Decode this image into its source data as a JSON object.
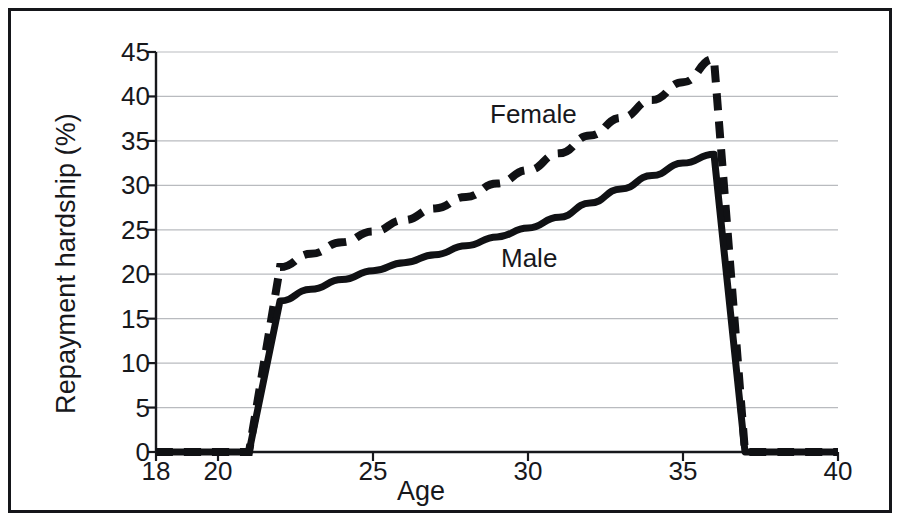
{
  "figure": {
    "border_color": "#15161a",
    "background": "#ffffff",
    "ink_color": "#17181c",
    "gridline_color": "#b9bbbf"
  },
  "axes": {
    "y_title": "Repayment hardship (%)",
    "x_title": "Age",
    "y_ticks": [
      "0",
      "5",
      "10",
      "15",
      "20",
      "25",
      "30",
      "35",
      "40",
      "45"
    ],
    "x_ticks": [
      "18",
      "20",
      "25",
      "30",
      "35",
      "40"
    ]
  },
  "annotations": {
    "female_label": "Female",
    "male_label": "Male"
  },
  "chart_data": {
    "type": "line",
    "title": "",
    "xlabel": "Age",
    "ylabel": "Repayment hardship (%)",
    "xlim": [
      18,
      40
    ],
    "ylim": [
      0,
      45
    ],
    "xtick_values": [
      18,
      20,
      25,
      30,
      35,
      40
    ],
    "ytick_values": [
      0,
      5,
      10,
      15,
      20,
      25,
      30,
      35,
      40,
      45
    ],
    "grid": "horizontal",
    "legend": "inline-annotations",
    "x": [
      18,
      19,
      20,
      21,
      22,
      23,
      24,
      25,
      26,
      27,
      28,
      29,
      30,
      31,
      32,
      33,
      34,
      35,
      36,
      37,
      38,
      39,
      40
    ],
    "series": [
      {
        "name": "Female",
        "style": "dashed",
        "color": "#101114",
        "values": [
          0,
          0,
          0,
          0,
          20.8,
          22.3,
          23.6,
          24.8,
          26.1,
          27.4,
          28.7,
          30.2,
          31.7,
          33.6,
          35.6,
          37.6,
          39.6,
          41.6,
          44.2,
          0,
          0,
          0,
          0
        ]
      },
      {
        "name": "Male",
        "style": "solid",
        "color": "#101114",
        "values": [
          0,
          0,
          0,
          0,
          17.0,
          18.3,
          19.4,
          20.4,
          21.3,
          22.2,
          23.2,
          24.2,
          25.2,
          26.4,
          28.0,
          29.6,
          31.1,
          32.5,
          33.5,
          0,
          0,
          0,
          0
        ]
      }
    ]
  }
}
